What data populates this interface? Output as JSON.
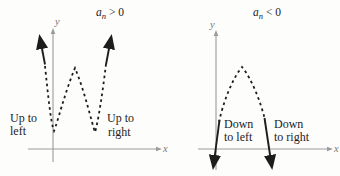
{
  "colors": {
    "background": "#fdfdfc",
    "axis": "#9b9b9b",
    "ink": "#1c1c1c"
  },
  "panels": {
    "left": {
      "title": {
        "coefficient": "a",
        "subscript": "n",
        "condition": "> 0"
      },
      "y_axis_label": "y",
      "x_axis_label": "x",
      "labels": {
        "left_arm": [
          "Up to",
          "left"
        ],
        "right_arm": [
          "Up to",
          "right"
        ]
      }
    },
    "right": {
      "title": {
        "coefficient": "a",
        "subscript": "n",
        "condition": "< 0"
      },
      "y_axis_label": "y",
      "x_axis_label": "x",
      "labels": {
        "left_arm": [
          "Down",
          "to left"
        ],
        "right_arm": [
          "Down",
          "to right"
        ]
      }
    }
  }
}
